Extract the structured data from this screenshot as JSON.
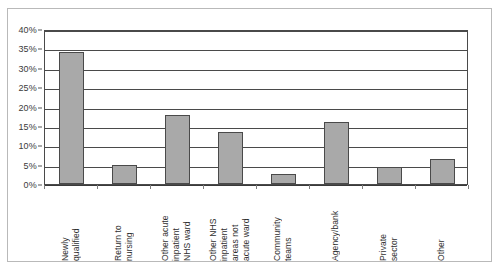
{
  "chart_data": {
    "type": "bar",
    "title": "",
    "xlabel": "",
    "ylabel": "",
    "categories": [
      "Newly qualified",
      "Return to nursing",
      "Other acute inpatient NHS ward",
      "Other NHS inpatient areas not acute ward",
      "Community teams",
      "Agency/bank",
      "Private sector",
      "Other"
    ],
    "category_lines": [
      [
        "Newly",
        "qualified"
      ],
      [
        "Return to",
        "nursing"
      ],
      [
        "Other acute",
        "inpatient",
        "NHS ward"
      ],
      [
        "Other NHS",
        "inpatient",
        "areas not",
        "acute ward"
      ],
      [
        "Community",
        "teams"
      ],
      [
        "Agency/bank"
      ],
      [
        "Private",
        "sector"
      ],
      [
        "Other"
      ]
    ],
    "values": [
      34,
      5,
      17.8,
      13.4,
      2.5,
      16,
      4.5,
      6.5
    ],
    "ylim": [
      0,
      40
    ],
    "ytick_values": [
      0,
      5,
      10,
      15,
      20,
      25,
      30,
      35,
      40
    ],
    "ytick_labels": [
      "0%",
      "5%",
      "10%",
      "15%",
      "20%",
      "25%",
      "30%",
      "35%",
      "40%"
    ],
    "grid": true,
    "legend": false,
    "bar_color": "#a9a9a9",
    "bar_border_color": "#4a4a4a",
    "gridline_color": "#4a4a4a",
    "axis_color": "#4a4a4a",
    "frame_color": "#b9b9b9"
  }
}
